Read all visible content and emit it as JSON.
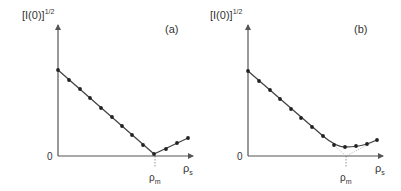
{
  "colors": {
    "axis": "#555555",
    "line": "#444444",
    "marker": "#222222",
    "guide": "#888888",
    "text": "#333333"
  },
  "chart_data": [
    {
      "type": "line",
      "panel_label": "(a)",
      "ylabel": "[I(0)]^1/2",
      "ylabel_base": "[I(0)]",
      "ylabel_exp": "1/2",
      "xlabel": "ρs",
      "xlabel_base": "ρ",
      "xlabel_sub": "s",
      "origin_label": "0",
      "annotation": {
        "text_base": "ρ",
        "text_sub": "m",
        "x": 9.0,
        "description": "match point where line reaches zero (dashed vertical)"
      },
      "grid": false,
      "xlim": [
        0,
        13
      ],
      "ylim": [
        0,
        12
      ],
      "series": [
        {
          "name": "data",
          "x": [
            0,
            1,
            2,
            3,
            4,
            5,
            6,
            7,
            8,
            9,
            10,
            11,
            12
          ],
          "y": [
            7.6,
            6.7,
            5.9,
            5.1,
            4.2,
            3.4,
            2.6,
            1.8,
            0.9,
            0.1,
            0.6,
            1.1,
            1.5
          ]
        }
      ]
    },
    {
      "type": "line",
      "panel_label": "(b)",
      "ylabel": "[I(0)]^1/2",
      "ylabel_base": "[I(0)]",
      "ylabel_exp": "1/2",
      "xlabel": "ρs",
      "xlabel_base": "ρ",
      "xlabel_sub": "s",
      "origin_label": "0",
      "annotation": {
        "text_base": "ρ",
        "text_sub": "m",
        "x": 9.0,
        "description": "intersection of dotted linear extrapolations (dashed vertical)"
      },
      "grid": false,
      "xlim": [
        0,
        13
      ],
      "ylim": [
        0,
        12
      ],
      "series": [
        {
          "name": "data",
          "x": [
            0,
            1,
            2,
            3,
            4,
            5,
            6,
            7,
            8,
            9,
            10,
            11,
            12
          ],
          "y": [
            7.6,
            6.7,
            5.9,
            5.1,
            4.2,
            3.4,
            2.6,
            1.8,
            0.9,
            0.7,
            0.8,
            1.0,
            1.4
          ]
        },
        {
          "name": "extrapolation",
          "style": "dotted",
          "x": [
            8,
            9,
            12
          ],
          "y": [
            0.9,
            0.0,
            1.4
          ]
        }
      ]
    }
  ],
  "panels": [
    {
      "id": "a",
      "ox": 58,
      "oy": 156,
      "yTop": 25,
      "xRight": 193,
      "pts": [
        [
          58,
          70
        ],
        [
          69,
          80
        ],
        [
          80,
          89
        ],
        [
          90,
          98
        ],
        [
          101,
          108
        ],
        [
          112,
          117
        ],
        [
          122,
          126
        ],
        [
          132,
          135
        ],
        [
          143,
          145
        ],
        [
          154,
          154
        ],
        [
          166,
          149
        ],
        [
          177,
          143
        ],
        [
          188,
          138
        ]
      ],
      "curve": "M58,70 L154,154 L188,138",
      "dotted": "",
      "rho_m_x": 155
    },
    {
      "id": "b",
      "ox": 248,
      "oy": 156,
      "yTop": 25,
      "xRight": 383,
      "pts": [
        [
          248,
          71
        ],
        [
          259,
          81
        ],
        [
          270,
          90
        ],
        [
          280,
          99
        ],
        [
          291,
          109
        ],
        [
          301,
          118
        ],
        [
          312,
          127
        ],
        [
          323,
          136
        ],
        [
          334,
          145
        ],
        [
          345,
          147
        ],
        [
          356,
          146
        ],
        [
          367,
          144
        ],
        [
          377,
          140
        ]
      ],
      "curve": "M248,71 L323,136 Q336,147 345,147 Q358,147 367,144 L377,140",
      "dotted": "M334,145 L346,156 L377,140",
      "rho_m_x": 346
    }
  ]
}
